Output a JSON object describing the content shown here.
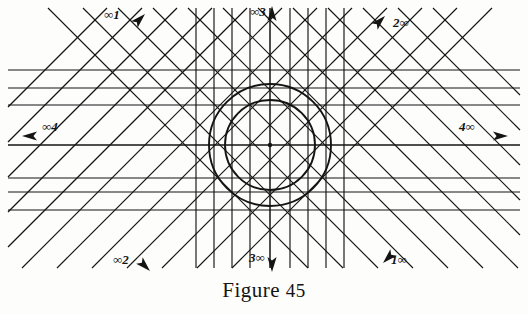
{
  "figure": {
    "caption_text": "Figure",
    "caption_number": "45",
    "caption_full": "Figure 45",
    "center": {
      "x": 270,
      "y": 145
    },
    "background_color": "#fdfdfc",
    "ink_color": "#141414"
  },
  "labels": [
    {
      "id": "label-inf-1",
      "text": "∞1",
      "x": 104,
      "y": 8,
      "arrow": "up-right",
      "position": "top-left"
    },
    {
      "id": "label-inf-3",
      "text": "∞3",
      "x": 250,
      "y": 5,
      "arrow": "up",
      "position": "top-center"
    },
    {
      "id": "label-2-inf",
      "text": "2∞",
      "x": 393,
      "y": 16,
      "arrow": "up-right",
      "position": "top-right"
    },
    {
      "id": "label-inf-4",
      "text": "∞4",
      "x": 42,
      "y": 120,
      "arrow": "left",
      "position": "middle-left"
    },
    {
      "id": "label-4-inf",
      "text": "4∞",
      "x": 459,
      "y": 120,
      "arrow": "right",
      "position": "middle-right"
    },
    {
      "id": "label-inf-2",
      "text": "∞2",
      "x": 113,
      "y": 253,
      "arrow": "down-right",
      "position": "bottom-left"
    },
    {
      "id": "label-3-inf",
      "text": "3∞",
      "x": 249,
      "y": 251,
      "arrow": "down",
      "position": "bottom-center"
    },
    {
      "id": "label-1-inf",
      "text": "1∞",
      "x": 391,
      "y": 253,
      "arrow": "down-left",
      "position": "bottom-right"
    }
  ],
  "geometry": {
    "circles": [
      {
        "name": "outer-circle",
        "cx": 270,
        "cy": 145,
        "r": 61
      },
      {
        "name": "inner-circle",
        "cx": 270,
        "cy": 145,
        "r": 45
      }
    ],
    "horizontal_lines_y": [
      70,
      88,
      105,
      145,
      178,
      192,
      210
    ],
    "vertical_lines_x": [
      196,
      214,
      232,
      250,
      270,
      290,
      308,
      326,
      344
    ],
    "diagonal_down_right_offsets": [
      -300,
      -265,
      -230,
      -195,
      -160,
      -125,
      -90,
      -55,
      -20,
      15,
      50,
      85
    ],
    "diagonal_up_right_offsets": [
      -300,
      -265,
      -230,
      -195,
      -160,
      -125,
      -90,
      -55,
      -20,
      15,
      50,
      85
    ],
    "center_dot_radius": 2.2
  }
}
